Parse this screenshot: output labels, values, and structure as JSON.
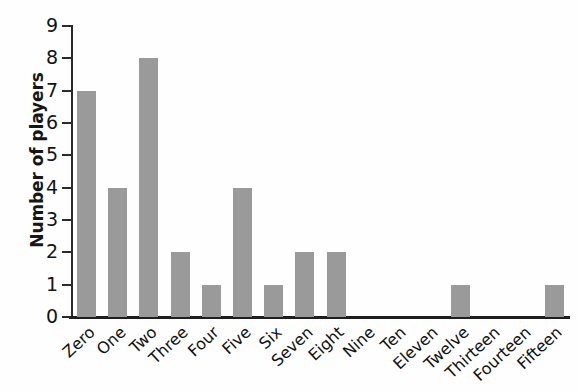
{
  "chart_data": {
    "type": "bar",
    "title": "",
    "xlabel": "",
    "ylabel": "Number of players",
    "categories": [
      "Zero",
      "One",
      "Two",
      "Three",
      "Four",
      "Five",
      "Six",
      "Seven",
      "Eight",
      "Nine",
      "Ten",
      "Eleven",
      "Twelve",
      "Thirteen",
      "Fourteen",
      "Fifteen"
    ],
    "values": [
      7,
      4,
      8,
      2,
      1,
      4,
      1,
      2,
      2,
      0,
      0,
      0,
      1,
      0,
      0,
      1
    ],
    "ylim": [
      0,
      9
    ],
    "y_ticks": [
      0,
      1,
      2,
      3,
      4,
      5,
      6,
      7,
      8,
      9
    ],
    "y_tick_labels": [
      "0",
      "1",
      "2",
      "3",
      "4",
      "5",
      "6",
      "7",
      "8",
      "9"
    ],
    "grid": false,
    "legend": null,
    "bar_color": "#9a9a9a",
    "axis_color": "#1e1e1e",
    "text_color": "#111111",
    "background_color": "#fefefe"
  }
}
